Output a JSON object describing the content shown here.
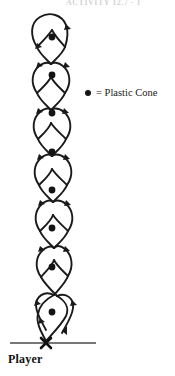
{
  "figure": {
    "title_strip": "ACTIVITY 12.7 - 1",
    "colors": {
      "path": "#1a1a1a",
      "cone": "#141414",
      "baseline": "#4a4a4a",
      "player_mark": "#111111",
      "background": "#ffffff"
    },
    "legend": {
      "symbol": "cone-dot-icon",
      "equals": "=",
      "label": "Plastic Cone",
      "text": "= Plastic Cone"
    },
    "player": {
      "label": "Player",
      "marker": "x-mark-icon",
      "marker_x": 46,
      "marker_y": 343
    },
    "baseline": {
      "name": "start-line",
      "x1": 10,
      "x2": 96,
      "y": 343
    },
    "cones": [
      {
        "id": 1,
        "cx": 52,
        "cy": 37
      },
      {
        "id": 2,
        "cx": 52,
        "cy": 75
      },
      {
        "id": 3,
        "cx": 52,
        "cy": 113
      },
      {
        "id": 4,
        "cx": 52,
        "cy": 152
      },
      {
        "id": 5,
        "cx": 52,
        "cy": 190
      },
      {
        "id": 6,
        "cx": 52,
        "cy": 228
      },
      {
        "id": 7,
        "cx": 52,
        "cy": 267
      },
      {
        "id": 8,
        "cx": 52,
        "cy": 312
      }
    ],
    "path_description": "Serpentine weave: player starts at the X on the baseline and travels up the column, looping alternately left and right around each plastic cone, crossing over between cones.",
    "cone_count": 8,
    "direction_arrows": 16
  }
}
